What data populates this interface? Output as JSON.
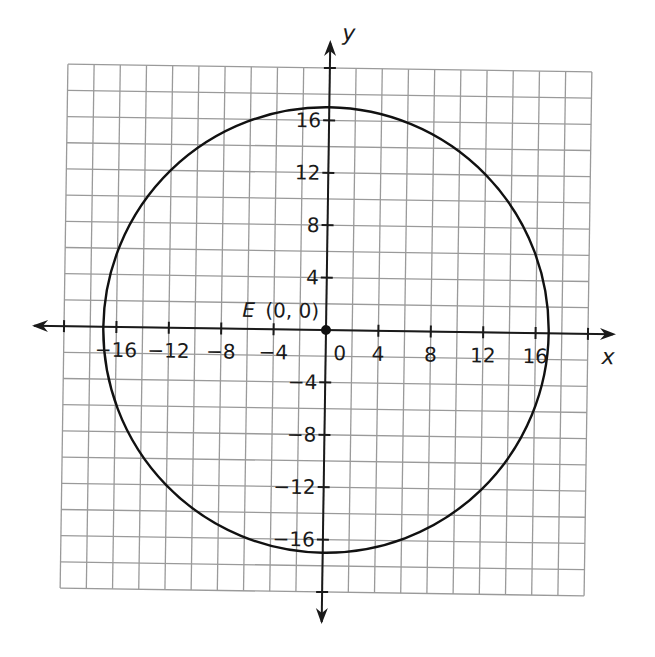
{
  "chart_data": {
    "type": "scatter",
    "title": "",
    "xlabel": "x",
    "ylabel": "y",
    "xlim": [
      -20,
      20
    ],
    "ylim": [
      -20,
      20
    ],
    "grid": true,
    "grid_step": 2,
    "x_ticks": [
      -16,
      -12,
      -8,
      -4,
      0,
      4,
      8,
      12,
      16
    ],
    "y_ticks": [
      -16,
      -12,
      -8,
      -4,
      4,
      8,
      12,
      16
    ],
    "x_tick_labels": [
      "−16",
      "−12",
      "−8",
      "−4",
      "0",
      "4",
      "8",
      "12",
      "16"
    ],
    "y_tick_labels": [
      "−16",
      "−12",
      "−8",
      "−4",
      "4",
      "8",
      "12",
      "16"
    ],
    "shapes": [
      {
        "type": "circle",
        "center": [
          0,
          0
        ],
        "radius": 17
      }
    ],
    "points": [
      {
        "name": "E",
        "x": 0,
        "y": 0,
        "label": "E (0, 0)"
      }
    ],
    "legend": null
  },
  "labels": {
    "x_axis": "x",
    "y_axis": "y",
    "point_name": "E",
    "point_coords": "(0, 0)"
  },
  "colors": {
    "grid": "#9a9a9a",
    "axis": "#1a1a1a",
    "curve": "#111111",
    "background": "#ffffff"
  }
}
